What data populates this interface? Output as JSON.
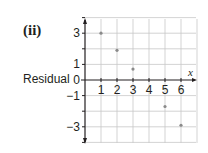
{
  "part_label": "(ii)",
  "chart_data": {
    "type": "scatter",
    "title": "",
    "xlabel": "x",
    "ylabel": "Residual",
    "x": [
      1,
      2,
      3,
      5,
      6
    ],
    "y": [
      3,
      1.9,
      0.7,
      -1.7,
      -2.9
    ],
    "xlim": [
      0,
      7
    ],
    "ylim": [
      -4,
      4
    ],
    "x_ticks": [
      "1",
      "2",
      "3",
      "4",
      "5",
      "6"
    ],
    "y_ticks": [
      "3",
      "1",
      "0",
      "−1",
      "−3"
    ],
    "grid": true,
    "legend": null,
    "colors": {
      "point": "#8a8a8a",
      "grid": "#c8c8c8",
      "axis": "#231f20"
    }
  }
}
